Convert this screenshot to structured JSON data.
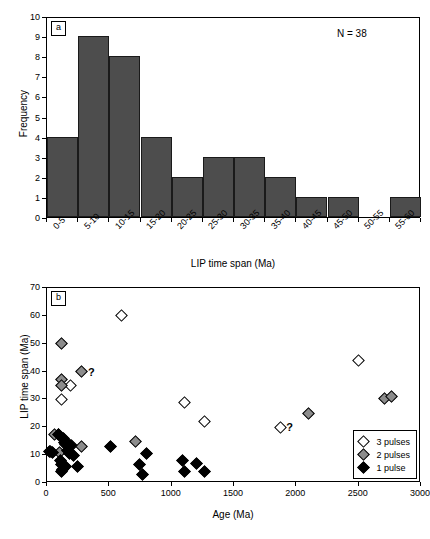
{
  "figure": {
    "panels": [
      {
        "tag": "a"
      },
      {
        "tag": "b"
      }
    ]
  },
  "panel_a": {
    "tag": "a",
    "annotation": "N = 38",
    "chart_data": {
      "type": "bar",
      "title": "",
      "xlabel": "LIP time span (Ma)",
      "ylabel": "Frequency",
      "categories": [
        "0-5",
        "5-10",
        "10-15",
        "15-20",
        "20-25",
        "25-30",
        "30-35",
        "35-40",
        "40-45",
        "45-50",
        "50-55",
        "55-60"
      ],
      "values": [
        4,
        9,
        8,
        4,
        2,
        3,
        3,
        2,
        1,
        1,
        0,
        1
      ],
      "ylim": [
        0,
        10
      ],
      "yticks": [
        0,
        1,
        2,
        3,
        4,
        5,
        6,
        7,
        8,
        9,
        10
      ],
      "grid": false,
      "legend": "none",
      "bar_color": "#4d4d4d",
      "bar_edge_color": "#1a1a1a",
      "n_total": 38
    }
  },
  "panel_b": {
    "tag": "b",
    "chart_data": {
      "type": "scatter",
      "title": "",
      "xlabel": "Age (Ma)",
      "ylabel": "LIP time span (Ma)",
      "xlim": [
        0,
        3000
      ],
      "ylim": [
        0,
        70
      ],
      "xticks": [
        0,
        500,
        1000,
        1500,
        2000,
        2500,
        3000
      ],
      "yticks": [
        0,
        10,
        20,
        30,
        40,
        50,
        60,
        70
      ],
      "grid": false,
      "legend_position": "lower-right",
      "series": [
        {
          "name": "3 pulses",
          "marker": "diamond",
          "fill": "#ffffff",
          "edge": "#000000",
          "points": [
            [
              600,
              60.2
            ],
            [
              2500,
              44
            ],
            [
              185,
              35
            ],
            [
              120,
              30
            ],
            [
              1100,
              29
            ],
            [
              1260,
              22
            ],
            [
              1870,
              20
            ],
            [
              95,
              17.5
            ]
          ]
        },
        {
          "name": "2 pulses",
          "marker": "diamond",
          "fill": "#8c8c8c",
          "edge": "#000000",
          "points": [
            [
              120,
              50
            ],
            [
              280,
              40
            ],
            [
              120,
              37
            ],
            [
              115,
              35
            ],
            [
              2710,
              30.2
            ],
            [
              2760,
              31
            ],
            [
              2100,
              25
            ],
            [
              710,
              15
            ],
            [
              275,
              13
            ],
            [
              200,
              13.5
            ],
            [
              60,
              17.5
            ],
            [
              30,
              11.3
            ],
            [
              100,
              11
            ],
            [
              150,
              14
            ]
          ]
        },
        {
          "name": "1 pulse",
          "marker": "diamond",
          "fill": "#000000",
          "edge": "#000000",
          "points": [
            [
              130,
              16
            ],
            [
              140,
              14.5
            ],
            [
              175,
              14
            ],
            [
              190,
              13.5
            ],
            [
              165,
              11.5
            ],
            [
              180,
              10.5
            ],
            [
              215,
              10
            ],
            [
              110,
              8
            ],
            [
              120,
              6.5
            ],
            [
              125,
              5
            ],
            [
              120,
              4
            ],
            [
              150,
              6
            ],
            [
              245,
              6
            ],
            [
              510,
              13
            ],
            [
              800,
              10.5
            ],
            [
              745,
              6.5
            ],
            [
              770,
              3
            ],
            [
              1090,
              8
            ],
            [
              1100,
              4
            ],
            [
              1200,
              7
            ],
            [
              1260,
              4
            ],
            [
              20,
              11.3
            ],
            [
              45,
              11
            ],
            [
              95,
              17.5
            ]
          ]
        }
      ],
      "annotations": [
        {
          "text": "?",
          "x": 280,
          "y": 40
        },
        {
          "text": "?",
          "x": 1870,
          "y": 20
        }
      ]
    },
    "legend": [
      {
        "label": "3 pulses",
        "fill": "#ffffff"
      },
      {
        "label": "2 pulses",
        "fill": "#8c8c8c"
      },
      {
        "label": "1 pulse",
        "fill": "#000000"
      }
    ]
  }
}
